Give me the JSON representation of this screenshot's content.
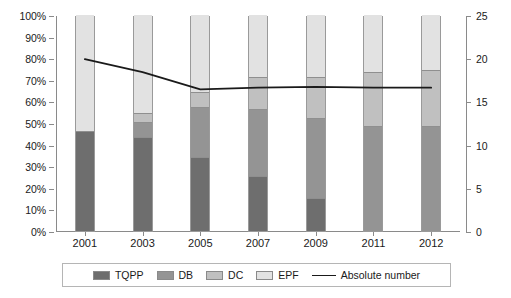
{
  "chart_data": {
    "type": "bar",
    "subtype": "100-percent-stacked-bar-with-line",
    "title": "",
    "xlabel": "",
    "ylabel": "",
    "categories": [
      "2001",
      "2003",
      "2005",
      "2007",
      "2009",
      "2011",
      "2012"
    ],
    "series": [
      {
        "name": "TQPP",
        "values": [
          46,
          43,
          34,
          25,
          15,
          0,
          0
        ],
        "color": "#6e6e6e"
      },
      {
        "name": "DB",
        "values": [
          0,
          7,
          23,
          31,
          37,
          48,
          48
        ],
        "color": "#949494"
      },
      {
        "name": "DC",
        "values": [
          0,
          4,
          7,
          15,
          19,
          25,
          26
        ],
        "color": "#c0c0c0"
      },
      {
        "name": "EPF",
        "values": [
          54,
          46,
          36,
          29,
          29,
          27,
          26
        ],
        "color": "#e2e2e2"
      }
    ],
    "line_series": {
      "name": "Absolute number",
      "values": [
        20,
        18.5,
        16.5,
        16.7,
        16.8,
        16.7,
        16.7
      ],
      "color": "#1a1a1a",
      "axis": "right"
    },
    "left_axis": {
      "ticks": [
        "0%",
        "10%",
        "20%",
        "30%",
        "40%",
        "50%",
        "60%",
        "70%",
        "80%",
        "90%",
        "100%"
      ],
      "min": 0,
      "max": 100
    },
    "right_axis": {
      "ticks": [
        "0",
        "5",
        "10",
        "15",
        "20",
        "25"
      ],
      "min": 0,
      "max": 25
    },
    "grid": false,
    "legend_position": "bottom"
  },
  "legend": {
    "items": [
      {
        "label": "TQPP",
        "color": "#6e6e6e",
        "marker": "swatch"
      },
      {
        "label": "DB",
        "color": "#949494",
        "marker": "swatch"
      },
      {
        "label": "DC",
        "color": "#c0c0c0",
        "marker": "swatch"
      },
      {
        "label": "EPF",
        "color": "#e2e2e2",
        "marker": "swatch"
      },
      {
        "label": "Absolute number",
        "color": "#1a1a1a",
        "marker": "line"
      }
    ]
  }
}
